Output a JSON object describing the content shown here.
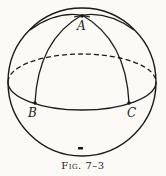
{
  "figure": {
    "caption": "Fig. 7–3",
    "points": [
      {
        "label": "A",
        "x": 82,
        "y": 15
      },
      {
        "label": "B",
        "x": 35,
        "y": 103
      },
      {
        "label": "C",
        "x": 129,
        "y": 103
      }
    ]
  }
}
